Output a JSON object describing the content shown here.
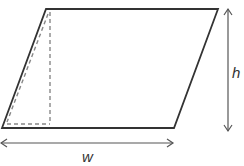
{
  "diagram": {
    "shape": "parallelogram",
    "labels": {
      "height": "h",
      "width": "w"
    },
    "vertices": {
      "top_left": [
        46,
        9
      ],
      "top_right": [
        218,
        9
      ],
      "bottom_right": [
        174,
        128
      ],
      "bottom_left": [
        2,
        128
      ]
    },
    "colors": {
      "outline": "#333333",
      "dashed": "#888888",
      "arrow": "#555555",
      "background": "#ffffff"
    }
  }
}
